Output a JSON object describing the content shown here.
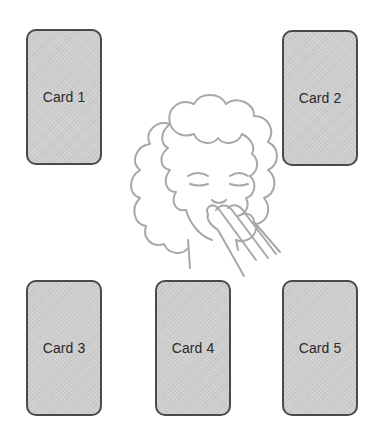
{
  "cards": [
    {
      "id": "card-1",
      "label": "Card 1"
    },
    {
      "id": "card-2",
      "label": "Card 2"
    },
    {
      "id": "card-3",
      "label": "Card 3"
    },
    {
      "id": "card-4",
      "label": "Card 4"
    },
    {
      "id": "card-5",
      "label": "Card 5"
    }
  ],
  "figure": {
    "icon": "person-thinking-illustration"
  },
  "colors": {
    "card_fill": "#cfcfcf",
    "card_border": "#4a4a4a",
    "label_text": "#2a2a2a",
    "illustration_stroke": "#a8a8a8",
    "background": "#ffffff"
  }
}
